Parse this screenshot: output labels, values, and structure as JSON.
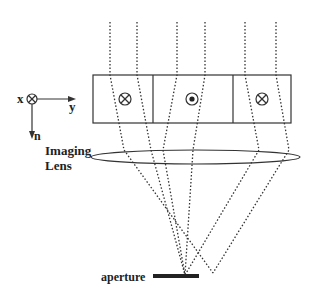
{
  "labels": {
    "axis_x": "x",
    "axis_y": "y",
    "axis_n": "n",
    "lens_line1": "Imaging",
    "lens_line2": "Lens",
    "aperture": "aperture"
  },
  "cells": [
    {
      "symbol": "cross-in-circle",
      "meaning": "into page"
    },
    {
      "symbol": "dot-in-circle",
      "meaning": "out of page"
    },
    {
      "symbol": "cross-in-circle",
      "meaning": "into page"
    }
  ],
  "colors": {
    "line": "#333333",
    "background": "#ffffff"
  }
}
